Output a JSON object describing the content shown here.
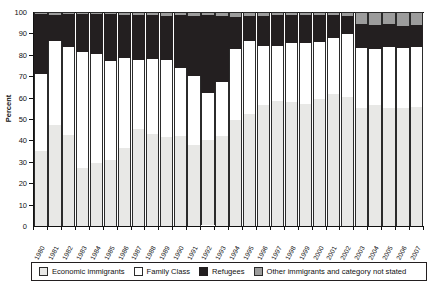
{
  "axis": {
    "ylabel": "Percent",
    "yticks": [
      "0",
      "10",
      "20",
      "30",
      "40",
      "50",
      "60",
      "70",
      "80",
      "90",
      "100"
    ]
  },
  "legend": {
    "items": [
      {
        "label": "Economic immigrants",
        "color": "#e8e8e6",
        "key": "economic"
      },
      {
        "label": "Family Class",
        "color": "#ffffff",
        "key": "family"
      },
      {
        "label": "Refugees",
        "color": "#231f20",
        "key": "refugees"
      },
      {
        "label": "Other immigrants and category not stated",
        "color": "#9c9c9c",
        "key": "other"
      }
    ]
  },
  "chart_data": {
    "type": "bar",
    "subtype": "stacked-100-percent",
    "title": "",
    "xlabel": "",
    "ylabel": "Percent",
    "ylim": [
      0,
      100
    ],
    "ytick_step": 10,
    "grid": false,
    "legend_position": "bottom",
    "categories": [
      "1980",
      "1981",
      "1982",
      "1983",
      "1984",
      "1985",
      "1986",
      "1987",
      "1988",
      "1989",
      "1990",
      "1991",
      "1992",
      "1993",
      "1994",
      "1995",
      "1996",
      "1997",
      "1998",
      "1999",
      "2000",
      "2001",
      "2002",
      "2003",
      "2004",
      "2005",
      "2006",
      "2007"
    ],
    "series": [
      {
        "name": "Economic immigrants",
        "color": "#e8e8e6",
        "values": [
          35,
          47,
          42.5,
          27,
          29.5,
          31,
          36.5,
          45.5,
          43,
          41.5,
          42,
          38,
          39.5,
          42,
          49.5,
          52.5,
          56.5,
          58.5,
          58,
          57,
          59.5,
          61.5,
          60.5,
          55,
          56.5,
          55,
          55,
          55.5
        ]
      },
      {
        "name": "Family Class",
        "color": "#ffffff",
        "values": [
          36,
          39.5,
          41,
          54.5,
          51,
          46,
          42,
          32,
          35,
          36,
          32,
          32,
          22,
          25.5,
          33,
          34,
          27.5,
          25.5,
          27.5,
          28.5,
          26.5,
          26.5,
          29,
          28,
          26,
          28.5,
          28,
          28
        ]
      },
      {
        "name": "Refugees",
        "color": "#231f20",
        "values": [
          28,
          12,
          15.5,
          17.5,
          18.5,
          22,
          20,
          21,
          20.5,
          20.5,
          24.5,
          28,
          36.5,
          30.5,
          15,
          11.5,
          14,
          14.5,
          13,
          13,
          12.5,
          10.5,
          8.5,
          11.5,
          11.5,
          11,
          10.5,
          10.5
        ]
      },
      {
        "name": "Other immigrants and category not stated",
        "color": "#9c9c9c",
        "values": [
          1,
          1.5,
          1,
          1,
          1,
          1,
          1.5,
          1.5,
          1.5,
          2,
          1.5,
          2,
          1.5,
          2,
          2.5,
          2,
          2,
          1.5,
          1.5,
          1.5,
          1.5,
          1.5,
          2,
          5.5,
          6,
          5.5,
          6.5,
          6
        ]
      }
    ]
  }
}
